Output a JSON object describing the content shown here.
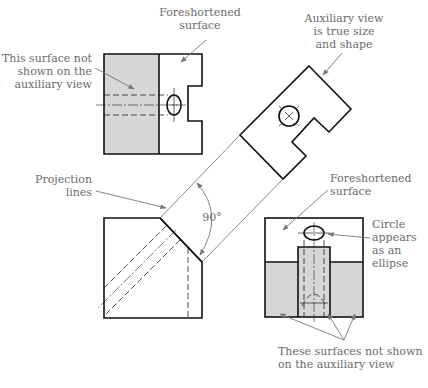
{
  "figure": {
    "type": "auxiliary-view-drawing",
    "colors": {
      "object_line": "#111111",
      "shading": "#d6d6d6",
      "label_text": "#6b6b6b",
      "leader": "#777777"
    }
  },
  "labels": {
    "foreshortened_top": [
      "Foreshortened",
      "surface"
    ],
    "not_shown_top": [
      "This surface not",
      "shown on the",
      "auxiliary view"
    ],
    "aux_true_size": [
      "Auxiliary view",
      "is true size",
      "and shape"
    ],
    "projection_lines": [
      "Projection",
      "lines"
    ],
    "angle": "90°",
    "foreshortened_bottom": [
      "Foreshortened",
      "surface"
    ],
    "circle_ellipse": [
      "Circle",
      "appears",
      "as an",
      "ellipse"
    ],
    "not_shown_bottom": [
      "These surfaces not shown",
      "on the auxiliary view"
    ]
  }
}
